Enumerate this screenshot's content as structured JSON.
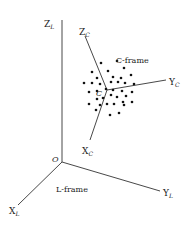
{
  "diagram": {
    "type": "coordinate-frames",
    "l_frame": {
      "label": "L-frame",
      "origin_label": "O",
      "origin": [
        62,
        162
      ],
      "axes": [
        {
          "name": "Z_L",
          "main": "Z",
          "sub": "L",
          "end": [
            62,
            20
          ],
          "label_pos": [
            44,
            27
          ]
        },
        {
          "name": "Y_L",
          "main": "Y",
          "sub": "L",
          "end": [
            160,
            191
          ],
          "label_pos": [
            163,
            196
          ]
        },
        {
          "name": "X_L",
          "main": "X",
          "sub": "L",
          "end": [
            18,
            205
          ],
          "label_pos": [
            9,
            214
          ]
        }
      ],
      "label_pos": [
        56,
        192
      ]
    },
    "c_frame": {
      "label": "C-frame",
      "center_label": "C",
      "center": [
        107,
        90
      ],
      "axes": [
        {
          "name": "Z_C",
          "main": "Z",
          "sub": "C",
          "end": [
            85,
            36
          ],
          "label_pos": [
            79,
            35
          ]
        },
        {
          "name": "Y_C",
          "main": "Y",
          "sub": "C",
          "end": [
            166,
            80
          ],
          "label_pos": [
            169,
            85
          ]
        },
        {
          "name": "X_C",
          "main": "X",
          "sub": "C",
          "end": [
            90,
            140
          ],
          "label_pos": [
            82,
            154
          ]
        }
      ],
      "label_pos": [
        116,
        63
      ]
    },
    "points": [
      [
        101,
        63
      ],
      [
        117,
        61
      ],
      [
        92,
        72
      ],
      [
        108,
        71
      ],
      [
        124,
        68
      ],
      [
        97,
        78
      ],
      [
        113,
        77
      ],
      [
        121,
        78
      ],
      [
        131,
        75
      ],
      [
        84,
        83
      ],
      [
        92,
        83
      ],
      [
        100,
        84
      ],
      [
        111,
        82
      ],
      [
        118,
        82
      ],
      [
        125,
        83
      ],
      [
        134,
        84
      ],
      [
        89,
        92
      ],
      [
        97,
        91
      ],
      [
        106,
        89
      ],
      [
        113,
        90
      ],
      [
        122,
        91
      ],
      [
        132,
        92
      ],
      [
        89,
        104
      ],
      [
        97,
        99
      ],
      [
        103,
        98
      ],
      [
        111,
        95
      ],
      [
        117,
        97
      ],
      [
        126,
        96
      ],
      [
        132,
        102
      ],
      [
        96,
        110
      ],
      [
        107,
        104
      ],
      [
        114,
        104
      ],
      [
        124,
        105
      ],
      [
        110,
        115
      ],
      [
        119,
        113
      ],
      [
        100,
        105
      ],
      [
        123,
        102
      ]
    ]
  }
}
